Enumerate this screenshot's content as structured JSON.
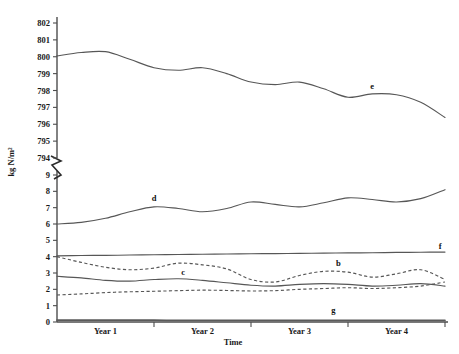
{
  "chart_data": {
    "type": "line",
    "title": "",
    "xlabel": "Time",
    "ylabel": "kg N/m²",
    "grid": false,
    "legend_position": "inline-labels",
    "axis_break": {
      "present": true,
      "between": [
        794,
        9
      ],
      "note": "y-axis broken between 794 and 9"
    },
    "y_upper_segment": {
      "ticks": [
        794,
        795,
        796,
        797,
        798,
        799,
        800,
        801,
        802
      ],
      "tick_labels": [
        "794",
        "795",
        "796",
        "797",
        "798",
        "799",
        "800",
        "801",
        "802"
      ],
      "ylim": [
        794,
        802
      ]
    },
    "y_lower_segment": {
      "ticks": [
        0,
        1,
        2,
        3,
        4,
        5,
        6,
        7,
        8,
        9
      ],
      "tick_labels": [
        "0",
        "1",
        "2",
        "3",
        "4",
        "5",
        "6",
        "7",
        "8",
        "9"
      ],
      "ylim": [
        0,
        9
      ]
    },
    "x_tick_labels": [
      "Year 1",
      "Year 2",
      "Year 3",
      "Year 4"
    ],
    "x": [
      0,
      0.25,
      0.5,
      0.75,
      1,
      1.25,
      1.5,
      1.75,
      2,
      2.25,
      2.5,
      2.75,
      3,
      3.25,
      3.5,
      3.75,
      4
    ],
    "series": [
      {
        "name": "e",
        "label": "e",
        "style": "solid",
        "segment": "upper",
        "values": [
          800.05,
          800.25,
          800.3,
          799.85,
          799.35,
          799.2,
          799.35,
          799.0,
          798.5,
          798.35,
          798.5,
          798.1,
          797.6,
          797.8,
          797.75,
          797.3,
          796.4
        ],
        "label_x": 3.25,
        "label_y": 798.1
      },
      {
        "name": "d",
        "label": "d",
        "style": "solid",
        "segment": "lower",
        "values": [
          6.0,
          6.1,
          6.35,
          6.75,
          7.05,
          6.95,
          6.75,
          6.95,
          7.35,
          7.2,
          7.05,
          7.3,
          7.6,
          7.5,
          7.35,
          7.55,
          8.1
        ],
        "label_x": 1.0,
        "label_y": 7.4
      },
      {
        "name": "f",
        "label": "f",
        "style": "solid",
        "segment": "lower",
        "values": [
          4.05,
          4.07,
          4.08,
          4.1,
          4.12,
          4.13,
          4.15,
          4.16,
          4.18,
          4.19,
          4.2,
          4.22,
          4.23,
          4.24,
          4.26,
          4.27,
          4.28
        ],
        "label_x": 3.95,
        "label_y": 4.45
      },
      {
        "name": "b",
        "label": "b",
        "style": "dashed",
        "segment": "lower",
        "values": [
          4.0,
          3.65,
          3.35,
          3.2,
          3.3,
          3.6,
          3.5,
          3.25,
          2.6,
          2.45,
          2.85,
          3.1,
          3.05,
          2.75,
          2.95,
          3.2,
          2.6
        ],
        "label_x": 2.9,
        "label_y": 3.45
      },
      {
        "name": "c",
        "label": "c",
        "style": "solid",
        "segment": "lower",
        "values": [
          2.8,
          2.7,
          2.55,
          2.5,
          2.6,
          2.65,
          2.55,
          2.4,
          2.25,
          2.2,
          2.3,
          2.35,
          2.3,
          2.2,
          2.25,
          2.35,
          2.2
        ],
        "label_x": 1.3,
        "label_y": 2.85
      },
      {
        "name": "a",
        "label": "a",
        "style": "dashed",
        "segment": "lower",
        "values": [
          1.65,
          1.72,
          1.8,
          1.85,
          1.88,
          1.92,
          1.95,
          1.93,
          1.9,
          1.92,
          2.0,
          2.05,
          2.1,
          2.05,
          2.1,
          2.2,
          2.45
        ],
        "label_x": 0.0,
        "label_y": 0.0
      },
      {
        "name": "g",
        "label": "g",
        "style": "solid-thick",
        "segment": "lower",
        "values": [
          0.12,
          0.12,
          0.11,
          0.11,
          0.11,
          0.1,
          0.1,
          0.1,
          0.1,
          0.1,
          0.1,
          0.1,
          0.1,
          0.1,
          0.1,
          0.1,
          0.1
        ],
        "label_x": 2.85,
        "label_y": 0.55
      }
    ]
  }
}
